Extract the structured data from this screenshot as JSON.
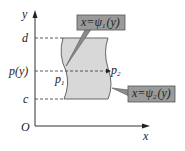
{
  "diagram": {
    "axes": {
      "x_label": "x",
      "y_label": "y",
      "origin_label": "O"
    },
    "y_marks": [
      {
        "label": "d",
        "y": 38
      },
      {
        "label": "p(y)",
        "y": 71
      },
      {
        "label": "c",
        "y": 99
      }
    ],
    "points": {
      "p1": {
        "base": "p",
        "sub": "1"
      },
      "p2": {
        "base": "p",
        "sub": "2"
      }
    },
    "callouts": [
      {
        "text": "x=ψ",
        "sub": "1",
        "tail": "(y)"
      },
      {
        "text": "x=ψ",
        "sub": "2",
        "tail": "(y)"
      }
    ],
    "colors": {
      "region_fill": "#d8d8d8",
      "callout_fill": "#9a9a9a",
      "stroke": "#555555"
    }
  }
}
